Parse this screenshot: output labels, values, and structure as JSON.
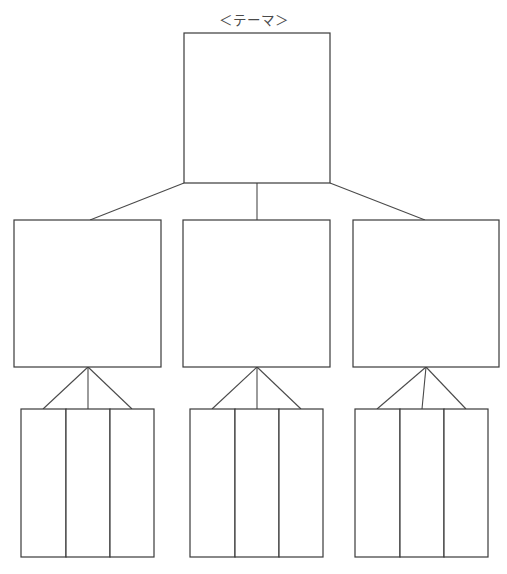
{
  "page": {
    "title": "＜テーマ＞",
    "background_color": "#ffffff",
    "line_color": "#3a3a3a",
    "text_color": "#4a4a4a",
    "width": 507,
    "height": 574
  },
  "diagram": {
    "type": "tree-chart",
    "orientation": "top-down",
    "levels": 3,
    "root": {
      "name": "theme-box",
      "label": "",
      "x": 184,
      "y": 33,
      "width": 146,
      "height": 150
    },
    "branches": [
      {
        "name": "branch-left",
        "label": "",
        "x": 14,
        "y": 220,
        "width": 147,
        "height": 147,
        "leaves": [
          {
            "name": "leaf-left-1",
            "label": "",
            "x": 21,
            "y": 409,
            "width": 45,
            "height": 148
          },
          {
            "name": "leaf-left-2",
            "label": "",
            "x": 66,
            "y": 409,
            "width": 44,
            "height": 148
          },
          {
            "name": "leaf-left-3",
            "label": "",
            "x": 110,
            "y": 409,
            "width": 44,
            "height": 148
          }
        ]
      },
      {
        "name": "branch-center",
        "label": "",
        "x": 183,
        "y": 220,
        "width": 147,
        "height": 147,
        "leaves": [
          {
            "name": "leaf-center-1",
            "label": "",
            "x": 190,
            "y": 409,
            "width": 45,
            "height": 148
          },
          {
            "name": "leaf-center-2",
            "label": "",
            "x": 235,
            "y": 409,
            "width": 44,
            "height": 148
          },
          {
            "name": "leaf-center-3",
            "label": "",
            "x": 279,
            "y": 409,
            "width": 44,
            "height": 148
          }
        ]
      },
      {
        "name": "branch-right",
        "label": "",
        "x": 353,
        "y": 220,
        "width": 146,
        "height": 147,
        "leaves": [
          {
            "name": "leaf-right-1",
            "label": "",
            "x": 355,
            "y": 409,
            "width": 45,
            "height": 148
          },
          {
            "name": "leaf-right-2",
            "label": "",
            "x": 400,
            "y": 409,
            "width": 44,
            "height": 148
          },
          {
            "name": "leaf-right-3",
            "label": "",
            "x": 444,
            "y": 409,
            "width": 44,
            "height": 148
          }
        ]
      }
    ],
    "connectors": [
      {
        "name": "connector-root-to-left",
        "x1": 184,
        "y1": 183,
        "x2": 90,
        "y2": 220
      },
      {
        "name": "connector-root-to-center",
        "x1": 257,
        "y1": 183,
        "x2": 257,
        "y2": 220
      },
      {
        "name": "connector-root-to-right",
        "x1": 330,
        "y1": 183,
        "x2": 425,
        "y2": 220
      },
      {
        "name": "connector-left-to-leaf-1",
        "x1": 88,
        "y1": 367,
        "x2": 43,
        "y2": 409
      },
      {
        "name": "connector-left-to-leaf-2",
        "x1": 88,
        "y1": 367,
        "x2": 88,
        "y2": 409
      },
      {
        "name": "connector-left-to-leaf-3",
        "x1": 88,
        "y1": 367,
        "x2": 132,
        "y2": 409
      },
      {
        "name": "connector-center-to-leaf-1",
        "x1": 257,
        "y1": 367,
        "x2": 212,
        "y2": 409
      },
      {
        "name": "connector-center-to-leaf-2",
        "x1": 257,
        "y1": 367,
        "x2": 257,
        "y2": 409
      },
      {
        "name": "connector-center-to-leaf-3",
        "x1": 257,
        "y1": 367,
        "x2": 301,
        "y2": 409
      },
      {
        "name": "connector-right-to-leaf-1",
        "x1": 426,
        "y1": 367,
        "x2": 377,
        "y2": 409
      },
      {
        "name": "connector-right-to-leaf-2",
        "x1": 426,
        "y1": 367,
        "x2": 422,
        "y2": 409
      },
      {
        "name": "connector-right-to-leaf-3",
        "x1": 426,
        "y1": 367,
        "x2": 466,
        "y2": 409
      }
    ]
  }
}
